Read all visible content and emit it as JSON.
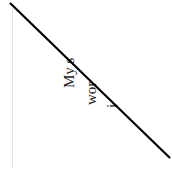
{
  "document": {
    "lines": [
      {
        "text": "My s"
      },
      {
        "text": "wor"
      },
      {
        "text": "i"
      }
    ],
    "strike_color": "#000000",
    "margin_color": "#e6e6e6"
  }
}
